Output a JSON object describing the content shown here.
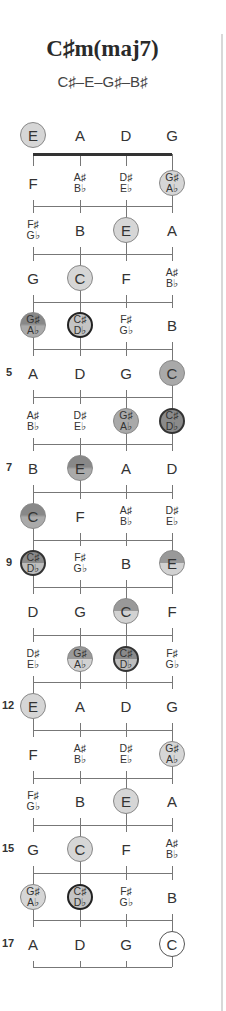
{
  "header": {
    "title": "C♯m(maj7)",
    "notes": "C♯–E–G♯–B♯"
  },
  "fretboard": {
    "strings": [
      "E",
      "A",
      "D",
      "G"
    ],
    "fret_numbers": {
      "5": "5",
      "7": "7",
      "9": "9",
      "12": "12",
      "15": "15",
      "17": "17"
    },
    "rows": [
      [
        {
          "t": "E",
          "s": "light"
        },
        {
          "t": "A"
        },
        {
          "t": "D"
        },
        {
          "t": "G"
        }
      ],
      [
        {
          "t": "F"
        },
        {
          "t": "A♯|B♭"
        },
        {
          "t": "D♯|E♭"
        },
        {
          "t": "G♯|A♭",
          "s": "light"
        }
      ],
      [
        {
          "t": "F♯|G♭"
        },
        {
          "t": "B"
        },
        {
          "t": "E",
          "s": "light"
        },
        {
          "t": "A"
        }
      ],
      [
        {
          "t": "G"
        },
        {
          "t": "C",
          "s": "light"
        },
        {
          "t": "F"
        },
        {
          "t": "A♯|B♭"
        }
      ],
      [
        {
          "t": "G♯|A♭",
          "s": "gradient"
        },
        {
          "t": "C♯|D♭",
          "s": "root"
        },
        {
          "t": "F♯|G♭"
        },
        {
          "t": "B"
        }
      ],
      [
        {
          "t": "A"
        },
        {
          "t": "D"
        },
        {
          "t": "G"
        },
        {
          "t": "C",
          "s": "mid"
        }
      ],
      [
        {
          "t": "A♯|B♭"
        },
        {
          "t": "D♯|E♭"
        },
        {
          "t": "G♯|A♭",
          "s": "mid"
        },
        {
          "t": "C♯|D♭",
          "s": "dark"
        }
      ],
      [
        {
          "t": "B"
        },
        {
          "t": "E",
          "s": "gradient"
        },
        {
          "t": "A"
        },
        {
          "t": "D"
        }
      ],
      [
        {
          "t": "C",
          "s": "gradient"
        },
        {
          "t": "F"
        },
        {
          "t": "A♯|B♭"
        },
        {
          "t": "D♯|E♭"
        }
      ],
      [
        {
          "t": "C♯|D♭",
          "s": "split2"
        },
        {
          "t": "F♯|G♭"
        },
        {
          "t": "B"
        },
        {
          "t": "E",
          "s": "split1"
        }
      ],
      [
        {
          "t": "D"
        },
        {
          "t": "G"
        },
        {
          "t": "C",
          "s": "split1"
        },
        {
          "t": "F"
        }
      ],
      [
        {
          "t": "D♯|E♭"
        },
        {
          "t": "G♯|A♭",
          "s": "split1"
        },
        {
          "t": "C♯|D♭",
          "s": "split2"
        },
        {
          "t": "F♯|G♭"
        }
      ],
      [
        {
          "t": "E",
          "s": "light"
        },
        {
          "t": "A"
        },
        {
          "t": "D"
        },
        {
          "t": "G"
        }
      ],
      [
        {
          "t": "F"
        },
        {
          "t": "A♯|B♭"
        },
        {
          "t": "D♯|E♭"
        },
        {
          "t": "G♯|A♭",
          "s": "light"
        }
      ],
      [
        {
          "t": "F♯|G♭"
        },
        {
          "t": "B"
        },
        {
          "t": "E",
          "s": "light"
        },
        {
          "t": "A"
        }
      ],
      [
        {
          "t": "G"
        },
        {
          "t": "C",
          "s": "light"
        },
        {
          "t": "F"
        },
        {
          "t": "A♯|B♭"
        }
      ],
      [
        {
          "t": "G♯|A♭",
          "s": "light"
        },
        {
          "t": "C♯|D♭",
          "s": "root"
        },
        {
          "t": "F♯|G♭"
        },
        {
          "t": "B"
        }
      ],
      [
        {
          "t": "A"
        },
        {
          "t": "D"
        },
        {
          "t": "G"
        },
        {
          "t": "C",
          "s": "open"
        }
      ]
    ]
  }
}
